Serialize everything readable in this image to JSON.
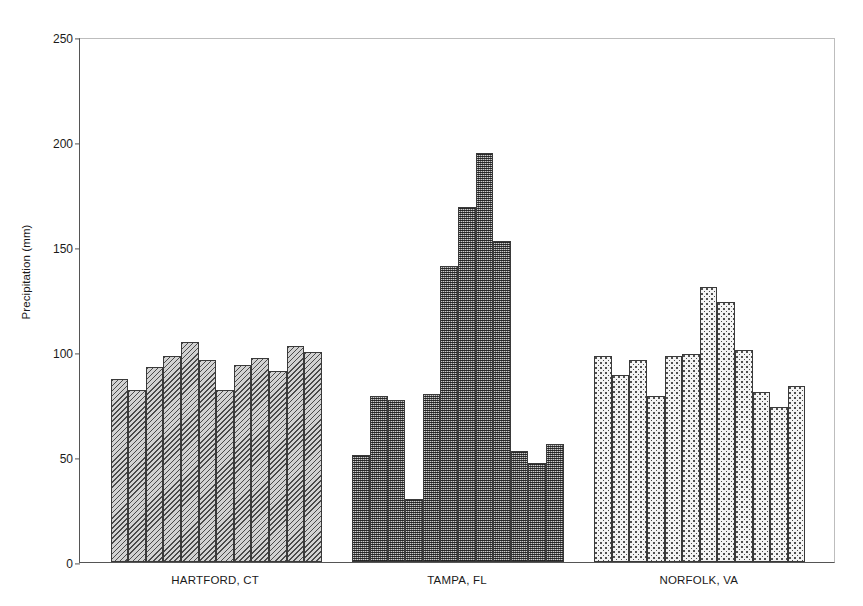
{
  "chart_data": {
    "type": "bar",
    "title": "",
    "xlabel": "",
    "ylabel": "Precipitation (mm)",
    "ylim": [
      0,
      250
    ],
    "yticks": [
      0,
      50,
      100,
      150,
      200,
      250
    ],
    "grid": false,
    "legend": null,
    "categories": [
      "Jan",
      "Feb",
      "Mar",
      "Apr",
      "May",
      "Jun",
      "Jul",
      "Aug",
      "Sep",
      "Oct",
      "Nov",
      "Dec"
    ],
    "groups": [
      {
        "name": "HARTFORD, CT",
        "pattern": "diagonal-hatch",
        "color": "#d2d2d2",
        "values": [
          87,
          82,
          93,
          98,
          105,
          96,
          82,
          94,
          97,
          91,
          103,
          100
        ]
      },
      {
        "name": "TAMPA, FL",
        "pattern": "dense-stipple",
        "color": "#6f6f6f",
        "values": [
          51,
          79,
          77,
          30,
          80,
          141,
          169,
          195,
          153,
          53,
          47,
          56
        ]
      },
      {
        "name": "NORFOLK, VA",
        "pattern": "sparse-dots",
        "color": "#f4f4f4",
        "values": [
          98,
          89,
          96,
          79,
          98,
          99,
          131,
          124,
          101,
          81,
          74,
          84
        ]
      }
    ]
  },
  "axis": {
    "y_title": "Precipitation (mm)",
    "tick_labels": [
      "0",
      "50",
      "100",
      "150",
      "200",
      "250"
    ]
  }
}
